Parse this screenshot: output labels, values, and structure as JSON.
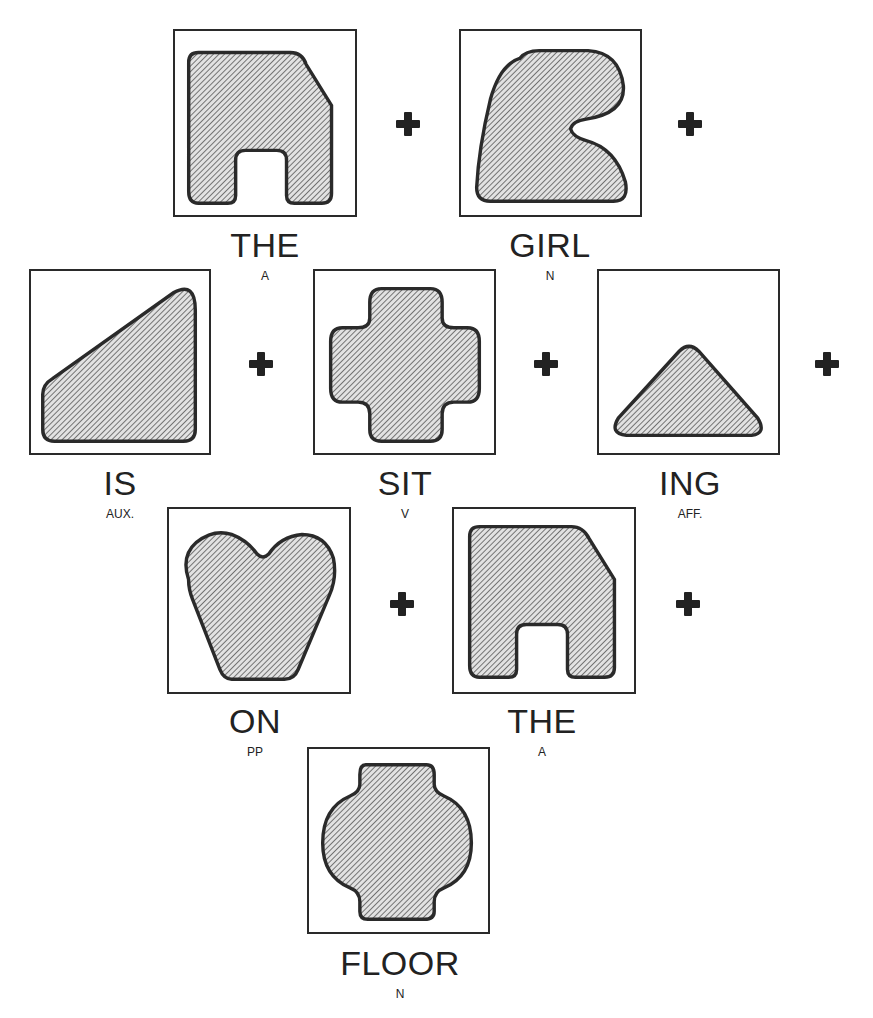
{
  "diagram": {
    "sentence": [
      "THE",
      "GIRL",
      "IS",
      "SIT",
      "ING",
      "ON",
      "THE",
      "FLOOR"
    ],
    "operator": "+",
    "cards": [
      {
        "word": "THE",
        "pos": "A",
        "shape": "house-arch-shape"
      },
      {
        "word": "GIRL",
        "pos": "N",
        "shape": "hook-shape"
      },
      {
        "word": "IS",
        "pos": "AUX.",
        "shape": "wedge-shape"
      },
      {
        "word": "SIT",
        "pos": "V",
        "shape": "cross-shape"
      },
      {
        "word": "ING",
        "pos": "AFF.",
        "shape": "triangle-shape"
      },
      {
        "word": "ON",
        "pos": "PP",
        "shape": "heart-trapezoid-shape"
      },
      {
        "word": "THE",
        "pos": "A",
        "shape": "house-arch-shape"
      },
      {
        "word": "FLOOR",
        "pos": "N",
        "shape": "rounded-cross-shape"
      }
    ]
  },
  "colors": {
    "stroke": "#2a2a2a",
    "hatch": "#555555",
    "fill": "#d8d8d8"
  }
}
